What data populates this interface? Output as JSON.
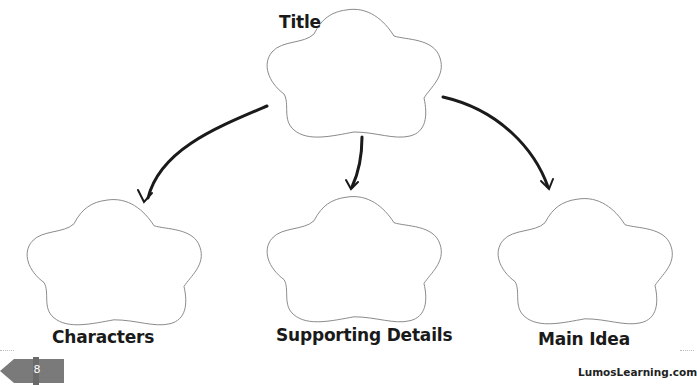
{
  "diagram": {
    "type": "cloud-web graphic organizer",
    "nodes": [
      {
        "id": "title",
        "label": "Title",
        "shape": "cloud"
      },
      {
        "id": "characters",
        "label": "Characters",
        "shape": "cloud"
      },
      {
        "id": "supporting_details",
        "label": "Supporting Details",
        "shape": "cloud"
      },
      {
        "id": "main_idea",
        "label": "Main Idea",
        "shape": "cloud"
      }
    ],
    "edges": [
      {
        "from": "title",
        "to": "characters"
      },
      {
        "from": "title",
        "to": "supporting_details"
      },
      {
        "from": "title",
        "to": "main_idea"
      }
    ]
  },
  "labels": {
    "title": "Title",
    "characters": "Characters",
    "supporting_details": "Supporting Details",
    "main_idea": "Main Idea"
  },
  "footer": {
    "page_number": "8",
    "site": "LumosLearning.com"
  },
  "colors": {
    "outline": "#8a8a8a",
    "arrow": "#1a1a1a",
    "badge": "#7a7a7a"
  }
}
